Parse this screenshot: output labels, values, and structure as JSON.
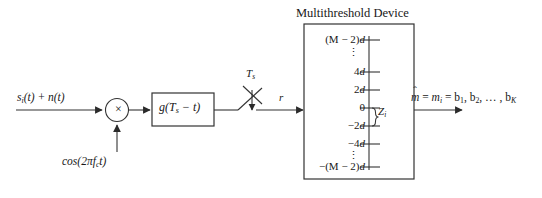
{
  "figure": {
    "title": "Multithreshold Device",
    "background_color": "#ffffff",
    "line_color": "#333333"
  },
  "signal_path": {
    "input_label": "s",
    "input_sub": "i",
    "input_rest": "(t) + n(t)",
    "carrier_label": "cos(2πf",
    "carrier_sub": "c",
    "carrier_rest": "t)",
    "multiplier_symbol": "×",
    "filter_label_pre": "g(T",
    "filter_sub": "s",
    "filter_label_post": " − t)",
    "sampler_label": "T",
    "sampler_sub": "s",
    "sampled_signal_label": "r"
  },
  "device": {
    "title": "Multithreshold Device",
    "decision_variable": "Z",
    "decision_variable_sub": "i",
    "levels": [
      {
        "kind": "label",
        "text_pre": "(M − 2)",
        "text_italic": "d"
      },
      {
        "kind": "dots",
        "text": "⋮"
      },
      {
        "kind": "label",
        "text_pre": "4",
        "text_italic": "d"
      },
      {
        "kind": "label",
        "text_pre": "2",
        "text_italic": "d"
      },
      {
        "kind": "label",
        "text_pre": "0",
        "text_italic": ""
      },
      {
        "kind": "label",
        "text_pre": "−2",
        "text_italic": "d"
      },
      {
        "kind": "label",
        "text_pre": "−4",
        "text_italic": "d"
      },
      {
        "kind": "dots",
        "text": "⋮"
      },
      {
        "kind": "label",
        "text_pre": "−(M − 2)",
        "text_italic": "d"
      }
    ]
  },
  "output": {
    "hat_symbol": "ˆ",
    "m_symbol": "m",
    "eq1": " = ",
    "mi_symbol": "m",
    "mi_sub": "i",
    "eq2": " = ",
    "bits": "b",
    "bit1_sub": "1",
    "bit_sep1": ", b",
    "bit2_sub": "2",
    "bit_sep2": ", … , b",
    "bitK_sub": "K"
  }
}
